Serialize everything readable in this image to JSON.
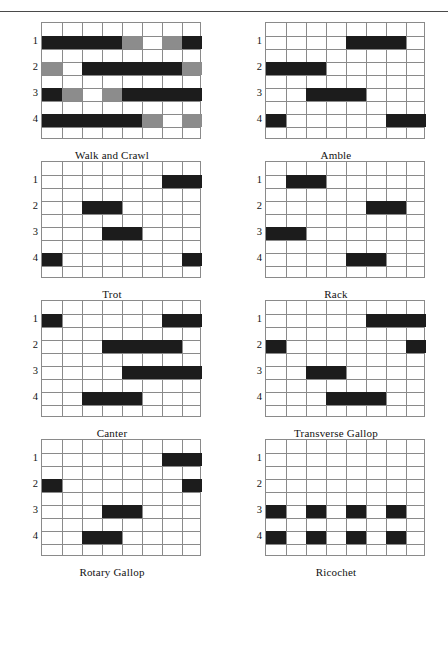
{
  "page": {
    "columns": 8,
    "rows": 9,
    "limb_labels": [
      "1",
      "2",
      "3",
      "4"
    ],
    "colors": {
      "bar": "#1c1c1c",
      "bar_secondary": "#8c8c8c",
      "grid": "#8a8a8a",
      "rule": "#4a4a4a",
      "background": "#ffffff"
    }
  },
  "chart_data": [
    {
      "type": "heatmap",
      "title": "Walk and Crawl",
      "xlabel": "",
      "ylabel": "",
      "categories": [
        "1",
        "2",
        "3",
        "4",
        "5",
        "6",
        "7",
        "8"
      ],
      "series": [
        {
          "name": "1",
          "values": [
            1,
            1,
            1,
            1,
            0.5,
            0,
            0.5,
            1
          ]
        },
        {
          "name": "2",
          "values": [
            0.5,
            0,
            1,
            1,
            1,
            1,
            1,
            0.5
          ]
        },
        {
          "name": "3",
          "values": [
            1,
            0.5,
            0,
            0.5,
            1,
            1,
            1,
            1
          ]
        },
        {
          "name": "4",
          "values": [
            1,
            1,
            1,
            1,
            1,
            0.5,
            0,
            0.5
          ]
        }
      ],
      "bars": [
        {
          "row": 1,
          "start": 1,
          "end": 4,
          "shade": "dark"
        },
        {
          "row": 1,
          "start": 5,
          "end": 5,
          "shade": "gray"
        },
        {
          "row": 1,
          "start": 7,
          "end": 7,
          "shade": "gray"
        },
        {
          "row": 1,
          "start": 8,
          "end": 8,
          "shade": "dark"
        },
        {
          "row": 2,
          "start": 1,
          "end": 1,
          "shade": "gray"
        },
        {
          "row": 2,
          "start": 3,
          "end": 7,
          "shade": "dark"
        },
        {
          "row": 2,
          "start": 8,
          "end": 8,
          "shade": "gray"
        },
        {
          "row": 3,
          "start": 1,
          "end": 1,
          "shade": "dark"
        },
        {
          "row": 3,
          "start": 2,
          "end": 2,
          "shade": "gray"
        },
        {
          "row": 3,
          "start": 4,
          "end": 4,
          "shade": "gray"
        },
        {
          "row": 3,
          "start": 5,
          "end": 8,
          "shade": "dark"
        },
        {
          "row": 4,
          "start": 1,
          "end": 5,
          "shade": "dark"
        },
        {
          "row": 4,
          "start": 6,
          "end": 6,
          "shade": "gray"
        },
        {
          "row": 4,
          "start": 8,
          "end": 8,
          "shade": "gray"
        }
      ]
    },
    {
      "type": "heatmap",
      "title": "Amble",
      "xlabel": "",
      "ylabel": "",
      "categories": [
        "1",
        "2",
        "3",
        "4",
        "5",
        "6",
        "7",
        "8"
      ],
      "series": [
        {
          "name": "1",
          "values": [
            0,
            0,
            0,
            0,
            1,
            1,
            1,
            0
          ]
        },
        {
          "name": "2",
          "values": [
            1,
            1,
            1,
            0,
            0,
            0,
            0,
            0
          ]
        },
        {
          "name": "3",
          "values": [
            0,
            0,
            1,
            1,
            1,
            0,
            0,
            0
          ]
        },
        {
          "name": "4",
          "values": [
            1,
            0,
            0,
            0,
            0,
            0,
            1,
            1
          ]
        }
      ],
      "bars": [
        {
          "row": 1,
          "start": 5,
          "end": 7,
          "shade": "dark"
        },
        {
          "row": 2,
          "start": 1,
          "end": 3,
          "shade": "dark"
        },
        {
          "row": 3,
          "start": 3,
          "end": 5,
          "shade": "dark"
        },
        {
          "row": 4,
          "start": 1,
          "end": 1,
          "shade": "dark"
        },
        {
          "row": 4,
          "start": 7,
          "end": 8,
          "shade": "dark"
        }
      ]
    },
    {
      "type": "heatmap",
      "title": "Trot",
      "xlabel": "",
      "ylabel": "",
      "categories": [
        "1",
        "2",
        "3",
        "4",
        "5",
        "6",
        "7",
        "8"
      ],
      "series": [
        {
          "name": "1",
          "values": [
            0,
            0,
            0,
            0,
            0,
            0,
            1,
            1
          ]
        },
        {
          "name": "2",
          "values": [
            0,
            0,
            1,
            1,
            0,
            0,
            0,
            0
          ]
        },
        {
          "name": "3",
          "values": [
            0,
            0,
            0,
            1,
            1,
            0,
            0,
            0
          ]
        },
        {
          "name": "4",
          "values": [
            1,
            0,
            0,
            0,
            0,
            0,
            0,
            1
          ]
        }
      ],
      "bars": [
        {
          "row": 1,
          "start": 7,
          "end": 8,
          "shade": "dark"
        },
        {
          "row": 2,
          "start": 3,
          "end": 4,
          "shade": "dark"
        },
        {
          "row": 3,
          "start": 4,
          "end": 5,
          "shade": "dark"
        },
        {
          "row": 4,
          "start": 1,
          "end": 1,
          "shade": "dark"
        },
        {
          "row": 4,
          "start": 8,
          "end": 8,
          "shade": "dark"
        }
      ]
    },
    {
      "type": "heatmap",
      "title": "Rack",
      "xlabel": "",
      "ylabel": "",
      "categories": [
        "1",
        "2",
        "3",
        "4",
        "5",
        "6",
        "7",
        "8"
      ],
      "series": [
        {
          "name": "1",
          "values": [
            0,
            1,
            1,
            0,
            0,
            0,
            0,
            0
          ]
        },
        {
          "name": "2",
          "values": [
            0,
            0,
            0,
            0,
            0,
            1,
            1,
            0
          ]
        },
        {
          "name": "3",
          "values": [
            1,
            1,
            0,
            0,
            0,
            0,
            0,
            0
          ]
        },
        {
          "name": "4",
          "values": [
            0,
            0,
            0,
            0,
            1,
            1,
            0,
            0
          ]
        }
      ],
      "bars": [
        {
          "row": 1,
          "start": 2,
          "end": 3,
          "shade": "dark"
        },
        {
          "row": 2,
          "start": 6,
          "end": 7,
          "shade": "dark"
        },
        {
          "row": 3,
          "start": 1,
          "end": 2,
          "shade": "dark"
        },
        {
          "row": 4,
          "start": 5,
          "end": 6,
          "shade": "dark"
        }
      ]
    },
    {
      "type": "heatmap",
      "title": "Canter",
      "xlabel": "",
      "ylabel": "",
      "categories": [
        "1",
        "2",
        "3",
        "4",
        "5",
        "6",
        "7",
        "8"
      ],
      "series": [
        {
          "name": "1",
          "values": [
            1,
            0,
            0,
            0,
            0,
            0,
            1,
            1
          ]
        },
        {
          "name": "2",
          "values": [
            0,
            0,
            0,
            1,
            1,
            1,
            1,
            0
          ]
        },
        {
          "name": "3",
          "values": [
            0,
            0,
            0,
            0,
            1,
            1,
            1,
            1
          ]
        },
        {
          "name": "4",
          "values": [
            0,
            0,
            1,
            1,
            1,
            0,
            0,
            0
          ]
        }
      ],
      "bars": [
        {
          "row": 1,
          "start": 1,
          "end": 1,
          "shade": "dark"
        },
        {
          "row": 1,
          "start": 7,
          "end": 8,
          "shade": "dark"
        },
        {
          "row": 2,
          "start": 4,
          "end": 7,
          "shade": "dark"
        },
        {
          "row": 3,
          "start": 5,
          "end": 8,
          "shade": "dark"
        },
        {
          "row": 4,
          "start": 3,
          "end": 5,
          "shade": "dark"
        }
      ]
    },
    {
      "type": "heatmap",
      "title": "Transverse Gallop",
      "xlabel": "",
      "ylabel": "",
      "categories": [
        "1",
        "2",
        "3",
        "4",
        "5",
        "6",
        "7",
        "8"
      ],
      "series": [
        {
          "name": "1",
          "values": [
            0,
            0,
            0,
            0,
            0,
            1,
            1,
            1
          ]
        },
        {
          "name": "2",
          "values": [
            1,
            0,
            0,
            0,
            0,
            0,
            0,
            1
          ]
        },
        {
          "name": "3",
          "values": [
            0,
            0,
            1,
            1,
            0,
            0,
            0,
            0
          ]
        },
        {
          "name": "4",
          "values": [
            0,
            0,
            0,
            1,
            1,
            1,
            0,
            0
          ]
        }
      ],
      "bars": [
        {
          "row": 1,
          "start": 6,
          "end": 8,
          "shade": "dark"
        },
        {
          "row": 2,
          "start": 1,
          "end": 1,
          "shade": "dark"
        },
        {
          "row": 2,
          "start": 8,
          "end": 8,
          "shade": "dark"
        },
        {
          "row": 3,
          "start": 3,
          "end": 4,
          "shade": "dark"
        },
        {
          "row": 4,
          "start": 4,
          "end": 6,
          "shade": "dark"
        }
      ]
    },
    {
      "type": "heatmap",
      "title": "Rotary Gallop",
      "xlabel": "",
      "ylabel": "",
      "categories": [
        "1",
        "2",
        "3",
        "4",
        "5",
        "6",
        "7",
        "8"
      ],
      "series": [
        {
          "name": "1",
          "values": [
            0,
            0,
            0,
            0,
            0,
            0,
            1,
            1
          ]
        },
        {
          "name": "2",
          "values": [
            1,
            0,
            0,
            0,
            0,
            0,
            0,
            1
          ]
        },
        {
          "name": "3",
          "values": [
            0,
            0,
            0,
            1,
            1,
            0,
            0,
            0
          ]
        },
        {
          "name": "4",
          "values": [
            0,
            0,
            1,
            1,
            0,
            0,
            0,
            0
          ]
        }
      ],
      "bars": [
        {
          "row": 1,
          "start": 7,
          "end": 8,
          "shade": "dark"
        },
        {
          "row": 2,
          "start": 1,
          "end": 1,
          "shade": "dark"
        },
        {
          "row": 2,
          "start": 8,
          "end": 8,
          "shade": "dark"
        },
        {
          "row": 3,
          "start": 4,
          "end": 5,
          "shade": "dark"
        },
        {
          "row": 4,
          "start": 3,
          "end": 4,
          "shade": "dark"
        }
      ]
    },
    {
      "type": "heatmap",
      "title": "Ricochet",
      "xlabel": "",
      "ylabel": "",
      "categories": [
        "1",
        "2",
        "3",
        "4",
        "5",
        "6",
        "7",
        "8"
      ],
      "series": [
        {
          "name": "1",
          "values": [
            0,
            0,
            0,
            0,
            0,
            0,
            0,
            0
          ]
        },
        {
          "name": "2",
          "values": [
            0,
            0,
            0,
            0,
            0,
            0,
            0,
            0
          ]
        },
        {
          "name": "3",
          "values": [
            1,
            0,
            1,
            0,
            1,
            0,
            1,
            0
          ]
        },
        {
          "name": "4",
          "values": [
            1,
            0,
            1,
            0,
            1,
            0,
            1,
            0
          ]
        }
      ],
      "bars": [
        {
          "row": 3,
          "start": 1,
          "end": 1,
          "shade": "dark"
        },
        {
          "row": 3,
          "start": 3,
          "end": 3,
          "shade": "dark"
        },
        {
          "row": 3,
          "start": 5,
          "end": 5,
          "shade": "dark"
        },
        {
          "row": 3,
          "start": 7,
          "end": 7,
          "shade": "dark"
        },
        {
          "row": 4,
          "start": 1,
          "end": 1,
          "shade": "dark"
        },
        {
          "row": 4,
          "start": 3,
          "end": 3,
          "shade": "dark"
        },
        {
          "row": 4,
          "start": 5,
          "end": 5,
          "shade": "dark"
        },
        {
          "row": 4,
          "start": 7,
          "end": 7,
          "shade": "dark"
        }
      ]
    }
  ]
}
